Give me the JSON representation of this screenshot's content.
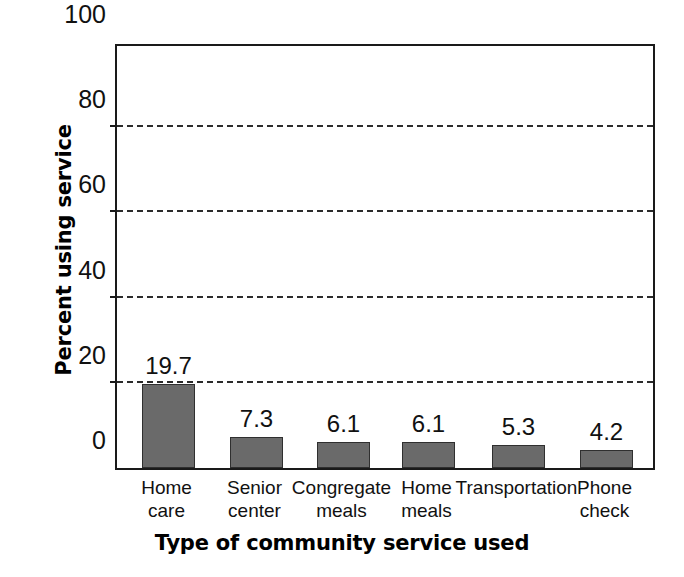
{
  "chart_data": {
    "type": "bar",
    "title": "",
    "xlabel": "Type of community service used",
    "ylabel": "Percent using service",
    "categories": [
      "Home care",
      "Senior center",
      "Congregate meals",
      "Home meals",
      "Transportation",
      "Phone check"
    ],
    "category_lines": [
      [
        "Home",
        "care"
      ],
      [
        "Senior",
        "center"
      ],
      [
        "Congregate",
        "meals"
      ],
      [
        "Home",
        "meals"
      ],
      [
        "Transportation",
        ""
      ],
      [
        "Phone",
        "check"
      ]
    ],
    "values": [
      19.7,
      7.3,
      6.1,
      6.1,
      5.3,
      4.2
    ],
    "value_labels": [
      "19.7",
      "7.3",
      "6.1",
      "6.1",
      "5.3",
      "4.2"
    ],
    "ylim": [
      0,
      100
    ],
    "yticks": [
      0,
      20,
      40,
      60,
      80,
      100
    ],
    "ytick_labels": [
      "0",
      "20",
      "40",
      "60",
      "80",
      "100"
    ],
    "gridlines_at": [
      20,
      40,
      60,
      80
    ],
    "grid": true,
    "grid_style": "dashed",
    "legend": null,
    "bar_color": "#6a6a6a",
    "bar_edge_color": "#2f2f2f",
    "axis_color": "#1a1a1a",
    "background_color": "#ffffff"
  }
}
